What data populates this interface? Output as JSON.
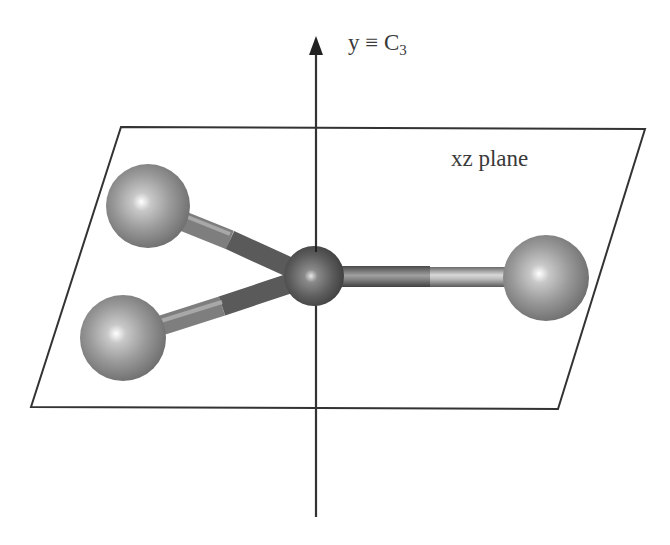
{
  "diagram": {
    "axis_label": {
      "symbol": "y",
      "relation": "≡",
      "operator": "C",
      "subscript": "3"
    },
    "plane_label": "xz plane",
    "elements": {
      "axis": {
        "name": "C3 rotation axis (y)",
        "direction": "up"
      },
      "plane": {
        "name": "xz plane",
        "shape": "parallelogram"
      },
      "central_atom": {
        "role": "central"
      },
      "ligand_atoms": [
        {
          "position": "upper-left"
        },
        {
          "position": "lower-left"
        },
        {
          "position": "right"
        }
      ],
      "bonds": 3
    },
    "colors": {
      "line": "#333333",
      "atom": "#8a8a8a",
      "central_atom": "#5a5a5a",
      "highlight": "#ffffff"
    }
  }
}
